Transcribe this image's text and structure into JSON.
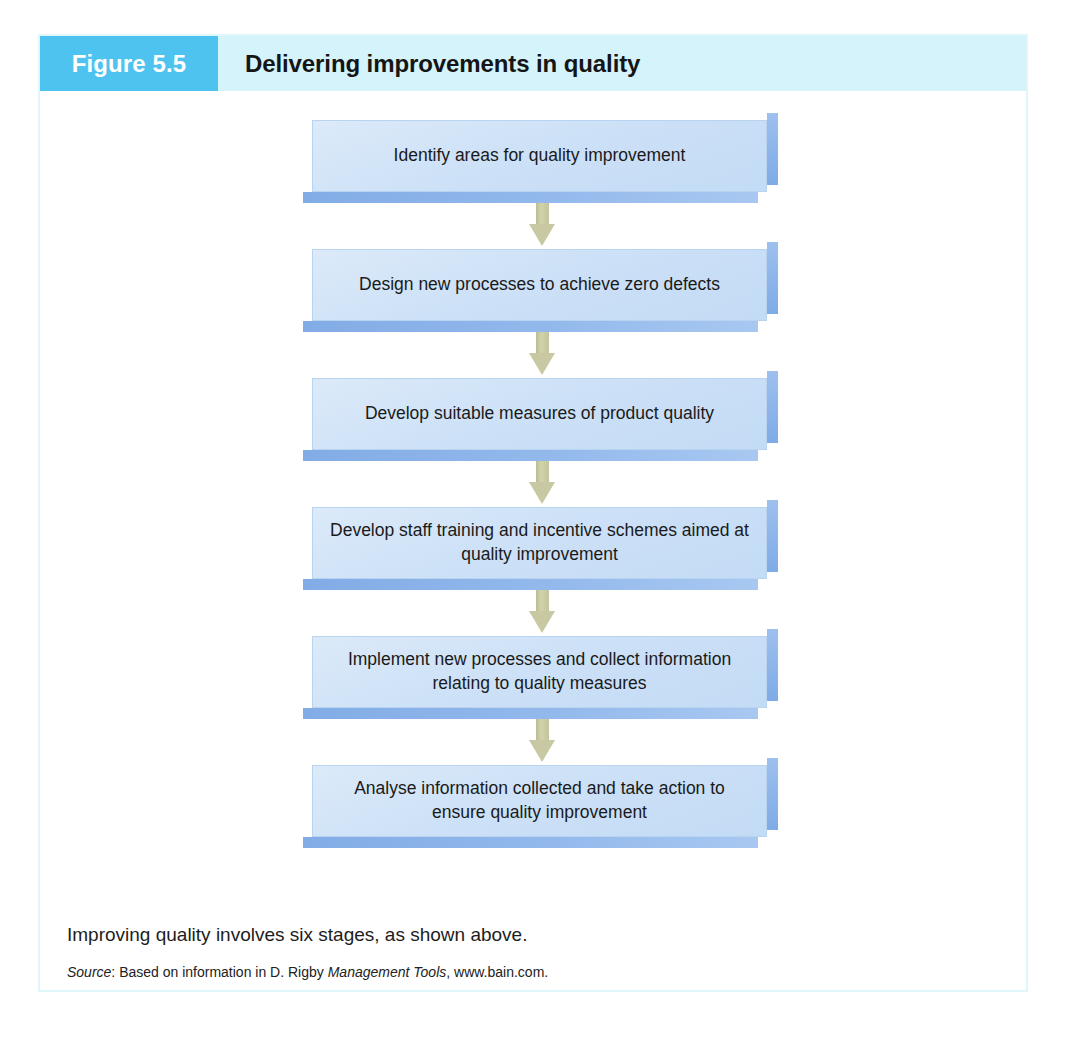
{
  "figure": {
    "badge_label": "Figure 5.5",
    "title": "Delivering improvements in quality",
    "caption": "Improving quality involves six stages, as shown above.",
    "source": {
      "label": "Source",
      "separator": ": ",
      "text_before": "Based on information in D. Rigby ",
      "work_title": "Management Tools",
      "text_after": ", www.bain.com."
    },
    "colors": {
      "badge_bg": "#4ec3ef",
      "header_bg": "#d4f3fa",
      "panel_border": "#dff6fa",
      "node_fill": "#cde1f7",
      "node_shadow": "#8ab4ea",
      "arrow_fill": "#c8c8a2",
      "text": "#1a1a1a"
    }
  },
  "flow": {
    "type": "vertical-process-flowchart",
    "step_count": 6,
    "steps": [
      {
        "index": 1,
        "text": "Identify areas for quality improvement"
      },
      {
        "index": 2,
        "text": "Design new processes to achieve zero defects"
      },
      {
        "index": 3,
        "text": "Develop suitable measures of product quality"
      },
      {
        "index": 4,
        "text": "Develop staff training and incentive schemes aimed at quality improvement"
      },
      {
        "index": 5,
        "text": "Implement new processes and collect information relating to quality measures"
      },
      {
        "index": 6,
        "text": "Analyse information collected and take action to ensure quality improvement"
      }
    ],
    "connector": "down-arrow"
  }
}
